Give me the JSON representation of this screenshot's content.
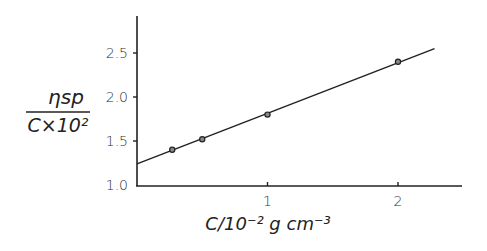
{
  "chart_data": {
    "type": "scatter",
    "title": "",
    "xlabel": "C/10⁻² g cm⁻³",
    "ylabel_numerator": "ηsp",
    "ylabel_denominator": "C×10²",
    "ylabel": "ηsp / (C×10²)",
    "xlim": [
      0,
      2.5
    ],
    "ylim": [
      1.0,
      2.8
    ],
    "x_ticks": [
      1,
      2
    ],
    "x_tick_labels": [
      "1",
      "2"
    ],
    "y_ticks": [
      1.0,
      1.5,
      2.0,
      2.5
    ],
    "y_tick_labels": [
      "1.0",
      "1.5",
      "2.0",
      "2.5"
    ],
    "grid": false,
    "legend": null,
    "series": [
      {
        "name": "measured",
        "marker": "open-circle",
        "x": [
          0.27,
          0.5,
          1.0,
          2.0
        ],
        "y": [
          1.4,
          1.52,
          1.8,
          2.4
        ]
      },
      {
        "name": "linear fit",
        "style": "line",
        "x": [
          0,
          2.28
        ],
        "y": [
          1.24,
          2.55
        ]
      }
    ],
    "colors": {
      "ink": "#222222",
      "background": "#ffffff"
    }
  }
}
